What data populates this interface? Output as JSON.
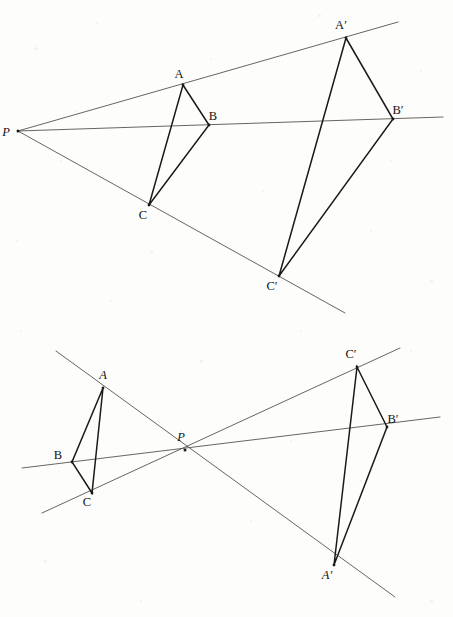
{
  "figure": {
    "background_color": "#fdfdfc",
    "ray_color": "#55544f",
    "edge_color": "#1a1a1a",
    "label_color": "#121212",
    "width": 453,
    "height": 617
  },
  "diagrams": [
    {
      "id": "top",
      "name": "external-center-homothety",
      "description": "Center P outside; triangle ABC maps to larger triangle A'B'C' with rays from P passing through corresponding vertices.",
      "center": {
        "label": "P",
        "italic": true,
        "x": 18,
        "y": 131,
        "label_x": 6,
        "label_y": 136
      },
      "points": [
        {
          "label": "A",
          "italic": false,
          "x": 183,
          "y": 85,
          "label_x": 179,
          "label_y": 78
        },
        {
          "label": "B",
          "italic": false,
          "x": 209,
          "y": 125,
          "label_x": 213,
          "label_y": 120
        },
        {
          "label": "C",
          "italic": false,
          "x": 149,
          "y": 205,
          "label_x": 143,
          "label_y": 219
        },
        {
          "label": "A′",
          "italic": false,
          "x": 346,
          "y": 38,
          "label_x": 341,
          "label_y": 29
        },
        {
          "label": "B′",
          "italic": false,
          "x": 393,
          "y": 119,
          "label_x": 398,
          "label_y": 114
        },
        {
          "label": "C′",
          "italic": false,
          "x": 279,
          "y": 276,
          "label_x": 272,
          "label_y": 290
        }
      ],
      "rays": [
        {
          "name": "ray-P-A-Aprime",
          "x1": 18,
          "y1": 131,
          "x2": 398,
          "y2": 22
        },
        {
          "name": "ray-P-B-Bprime",
          "x1": 18,
          "y1": 131,
          "x2": 443,
          "y2": 117
        },
        {
          "name": "ray-P-C-Cprime",
          "x1": 18,
          "y1": 131,
          "x2": 345,
          "y2": 313
        }
      ],
      "triangles": [
        {
          "name": "triangle-ABC",
          "vertices": [
            "A",
            "B",
            "C"
          ]
        },
        {
          "name": "triangle-ABC-prime",
          "vertices": [
            "A′",
            "B′",
            "C′"
          ]
        }
      ]
    },
    {
      "id": "bottom",
      "name": "central-point-reflection-homothety",
      "description": "Center P between the figures; triangle ABC maps to inverted larger triangle A'B'C' through P with negative ratio.",
      "center": {
        "label": "P",
        "italic": true,
        "x": 185,
        "y": 450,
        "label_x": 181,
        "label_y": 441
      },
      "points": [
        {
          "label": "A",
          "italic": true,
          "x": 103,
          "y": 388,
          "label_x": 103,
          "label_y": 379
        },
        {
          "label": "B",
          "italic": false,
          "x": 72,
          "y": 462,
          "label_x": 58,
          "label_y": 459
        },
        {
          "label": "C",
          "italic": false,
          "x": 92,
          "y": 493,
          "label_x": 87,
          "label_y": 506
        },
        {
          "label": "A′",
          "italic": true,
          "x": 334,
          "y": 565,
          "label_x": 327,
          "label_y": 579
        },
        {
          "label": "B′",
          "italic": false,
          "x": 387,
          "y": 427,
          "label_x": 393,
          "label_y": 423
        },
        {
          "label": "C′",
          "italic": false,
          "x": 357,
          "y": 367,
          "label_x": 351,
          "label_y": 358
        }
      ],
      "rays": [
        {
          "name": "ray-A-P-Aprime",
          "x1": 56,
          "y1": 351,
          "x2": 395,
          "y2": 597
        },
        {
          "name": "ray-B-P-Bprime",
          "x1": 22,
          "y1": 468,
          "x2": 440,
          "y2": 417
        },
        {
          "name": "ray-C-P-Cprime",
          "x1": 42,
          "y1": 513,
          "x2": 400,
          "y2": 348
        }
      ],
      "triangles": [
        {
          "name": "triangle-ABC",
          "vertices": [
            "A",
            "B",
            "C"
          ]
        },
        {
          "name": "triangle-ABC-prime",
          "vertices": [
            "A′",
            "B′",
            "C′"
          ]
        }
      ]
    }
  ]
}
